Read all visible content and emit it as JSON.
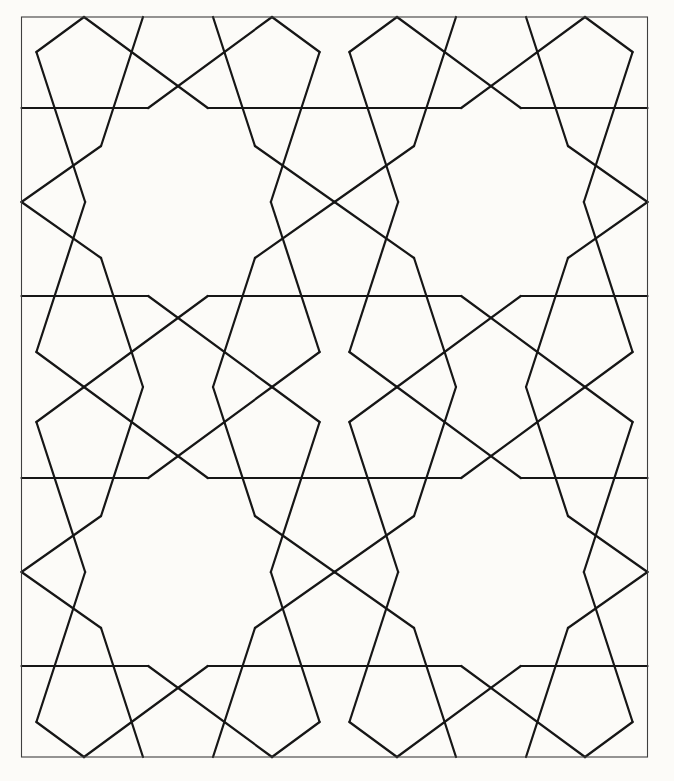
{
  "canvas": {
    "width": 674,
    "height": 781,
    "background": "#fcfbf8"
  },
  "frame": {
    "x": 21.5,
    "y": 17,
    "width": 626,
    "height": 740,
    "color": "#3f3f3f",
    "stroke_width": 1.1
  },
  "pattern": {
    "color": "#161616",
    "stroke_width": 2.2,
    "linecap": "round",
    "cells": [
      [
        178,
        202
      ],
      [
        491,
        202
      ],
      [
        178,
        572
      ],
      [
        491,
        572
      ]
    ],
    "mirrors": [
      [
        1,
        1
      ],
      [
        -1,
        1
      ],
      [
        1,
        -1
      ],
      [
        -1,
        -1
      ]
    ],
    "unit_segments": [
      [
        -94,
        -185,
        29.8,
        -94
      ],
      [
        -94,
        -185,
        -141.6,
        -150
      ],
      [
        -141.6,
        -150,
        -92.85,
        0
      ],
      [
        -35,
        -185,
        -76.95,
        -56
      ],
      [
        -76.95,
        -56,
        -156.5,
        0
      ],
      [
        -156.5,
        -94,
        -29.8,
        -94
      ]
    ]
  }
}
